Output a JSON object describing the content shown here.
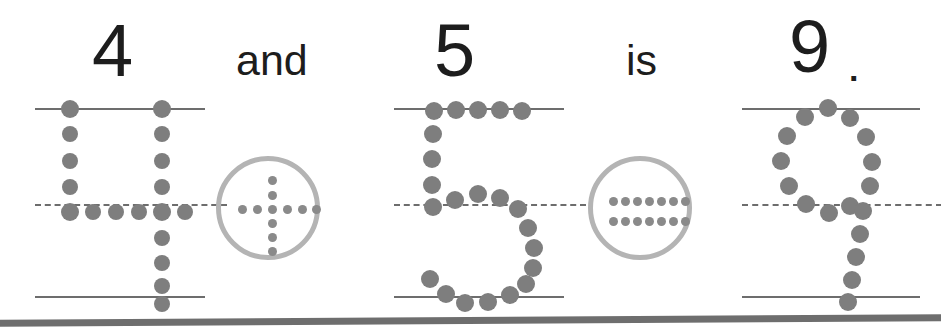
{
  "worksheet": {
    "type": "number-tracing-worksheet",
    "sentence": "4 and 5 is 9.",
    "caption_tokens": [
      {
        "name": "numeral-4",
        "text": "4",
        "kind": "numeral",
        "x": 92,
        "y": 14
      },
      {
        "name": "word-and",
        "text": "and",
        "kind": "word",
        "x": 236,
        "y": 39
      },
      {
        "name": "numeral-5",
        "text": "5",
        "kind": "numeral",
        "x": 434,
        "y": 14
      },
      {
        "name": "word-is",
        "text": "is",
        "kind": "word",
        "x": 626,
        "y": 39
      },
      {
        "name": "numeral-9",
        "text": "9",
        "kind": "numeral",
        "x": 789,
        "y": 10
      },
      {
        "name": "period",
        "text": ".",
        "kind": "period",
        "x": 849,
        "y": 52
      }
    ],
    "colors": {
      "text": "#1d1d1d",
      "trace_dot": "#7e7e7e",
      "guide_line": "#6d6d6d",
      "circle_stroke": "#b4b4b4",
      "operator_dot": "#8a8a8a",
      "page_edge": "#6e6e6e",
      "background": "#ffffff"
    },
    "trace_groups": [
      {
        "name": "trace-numeral-4",
        "numeral": "4",
        "x": 35,
        "width": 170,
        "dots": [
          {
            "x": 35,
            "y": 1,
            "r": 9
          },
          {
            "x": 35,
            "y": 26,
            "r": 8
          },
          {
            "x": 35,
            "y": 53,
            "r": 8
          },
          {
            "x": 35,
            "y": 79,
            "r": 8
          },
          {
            "x": 35,
            "y": 104,
            "r": 9
          },
          {
            "x": 58,
            "y": 104,
            "r": 8
          },
          {
            "x": 81,
            "y": 104,
            "r": 8
          },
          {
            "x": 104,
            "y": 104,
            "r": 8
          },
          {
            "x": 127,
            "y": 104,
            "r": 9
          },
          {
            "x": 150,
            "y": 104,
            "r": 8
          },
          {
            "x": 127,
            "y": 1,
            "r": 9
          },
          {
            "x": 127,
            "y": 26,
            "r": 8
          },
          {
            "x": 127,
            "y": 53,
            "r": 8
          },
          {
            "x": 127,
            "y": 79,
            "r": 8
          },
          {
            "x": 127,
            "y": 130,
            "r": 8
          },
          {
            "x": 127,
            "y": 155,
            "r": 8
          },
          {
            "x": 127,
            "y": 178,
            "r": 8
          },
          {
            "x": 127,
            "y": 196,
            "r": 8
          }
        ]
      },
      {
        "name": "trace-numeral-5",
        "numeral": "5",
        "x": 394,
        "width": 170,
        "dots": [
          {
            "x": 40,
            "y": 3,
            "r": 9
          },
          {
            "x": 62,
            "y": 2,
            "r": 9
          },
          {
            "x": 84,
            "y": 2,
            "r": 9
          },
          {
            "x": 106,
            "y": 2,
            "r": 9
          },
          {
            "x": 128,
            "y": 3,
            "r": 9
          },
          {
            "x": 39,
            "y": 26,
            "r": 9
          },
          {
            "x": 38,
            "y": 51,
            "r": 9
          },
          {
            "x": 38,
            "y": 77,
            "r": 9
          },
          {
            "x": 39,
            "y": 99,
            "r": 9
          },
          {
            "x": 61,
            "y": 92,
            "r": 9
          },
          {
            "x": 84,
            "y": 86,
            "r": 9
          },
          {
            "x": 106,
            "y": 90,
            "r": 9
          },
          {
            "x": 124,
            "y": 101,
            "r": 9
          },
          {
            "x": 134,
            "y": 120,
            "r": 9
          },
          {
            "x": 140,
            "y": 140,
            "r": 9
          },
          {
            "x": 139,
            "y": 160,
            "r": 9
          },
          {
            "x": 132,
            "y": 176,
            "r": 9
          },
          {
            "x": 116,
            "y": 187,
            "r": 9
          },
          {
            "x": 94,
            "y": 194,
            "r": 9
          },
          {
            "x": 71,
            "y": 195,
            "r": 9
          },
          {
            "x": 52,
            "y": 186,
            "r": 9
          },
          {
            "x": 36,
            "y": 171,
            "r": 9
          }
        ]
      },
      {
        "name": "trace-numeral-9",
        "numeral": "9",
        "x": 742,
        "width": 178,
        "dots": [
          {
            "x": 86,
            "y": 0,
            "r": 9
          },
          {
            "x": 63,
            "y": 9,
            "r": 9
          },
          {
            "x": 108,
            "y": 10,
            "r": 9
          },
          {
            "x": 45,
            "y": 28,
            "r": 9
          },
          {
            "x": 124,
            "y": 29,
            "r": 9
          },
          {
            "x": 39,
            "y": 53,
            "r": 9
          },
          {
            "x": 130,
            "y": 54,
            "r": 9
          },
          {
            "x": 47,
            "y": 78,
            "r": 9
          },
          {
            "x": 128,
            "y": 78,
            "r": 9
          },
          {
            "x": 64,
            "y": 96,
            "r": 9
          },
          {
            "x": 87,
            "y": 105,
            "r": 9
          },
          {
            "x": 108,
            "y": 98,
            "r": 9
          },
          {
            "x": 121,
            "y": 103,
            "r": 9
          },
          {
            "x": 118,
            "y": 126,
            "r": 9
          },
          {
            "x": 114,
            "y": 149,
            "r": 9
          },
          {
            "x": 110,
            "y": 172,
            "r": 9
          },
          {
            "x": 106,
            "y": 194,
            "r": 9
          }
        ]
      }
    ],
    "operators": [
      {
        "name": "operator-plus",
        "symbol": "plus",
        "label": "+",
        "x": 216,
        "y": 156,
        "size": 104,
        "dots": [
          {
            "x": 47,
            "y": 15
          },
          {
            "x": 47,
            "y": 30
          },
          {
            "x": 47,
            "y": 44
          },
          {
            "x": 47,
            "y": 58
          },
          {
            "x": 47,
            "y": 72
          },
          {
            "x": 47,
            "y": 86
          },
          {
            "x": 17,
            "y": 44
          },
          {
            "x": 32,
            "y": 44
          },
          {
            "x": 62,
            "y": 44
          },
          {
            "x": 77,
            "y": 44
          },
          {
            "x": 91,
            "y": 44
          }
        ]
      },
      {
        "name": "operator-equals",
        "symbol": "equals",
        "label": "=",
        "x": 588,
        "y": 156,
        "size": 104,
        "dots": [
          {
            "x": 16,
            "y": 36
          },
          {
            "x": 28,
            "y": 36
          },
          {
            "x": 40,
            "y": 36
          },
          {
            "x": 52,
            "y": 36
          },
          {
            "x": 64,
            "y": 36
          },
          {
            "x": 76,
            "y": 36
          },
          {
            "x": 88,
            "y": 36
          },
          {
            "x": 16,
            "y": 56
          },
          {
            "x": 28,
            "y": 56
          },
          {
            "x": 40,
            "y": 56
          },
          {
            "x": 52,
            "y": 56
          },
          {
            "x": 64,
            "y": 56
          },
          {
            "x": 76,
            "y": 56
          },
          {
            "x": 88,
            "y": 56
          }
        ]
      }
    ]
  }
}
